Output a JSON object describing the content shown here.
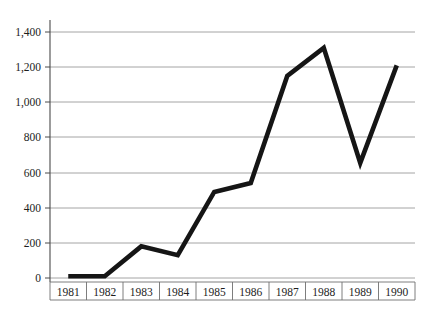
{
  "chart_data": {
    "type": "line",
    "title": "",
    "subtitle": "",
    "xlabel": "",
    "ylabel": "",
    "categories": [
      "1981",
      "1982",
      "1983",
      "1984",
      "1985",
      "1986",
      "1987",
      "1988",
      "1989",
      "1990"
    ],
    "values": [
      10,
      10,
      180,
      130,
      490,
      540,
      1150,
      1310,
      655,
      1210
    ],
    "series": [
      {
        "name": "",
        "values": [
          10,
          10,
          180,
          130,
          490,
          540,
          1150,
          1310,
          655,
          1210
        ]
      }
    ],
    "ylim": [
      0,
      1400
    ],
    "y_ticks": [
      0,
      200,
      400,
      600,
      800,
      1000,
      1200,
      1400
    ],
    "y_tick_labels": [
      "0",
      "200",
      "400",
      "600",
      "800",
      "1,000",
      "1,200",
      "1,400"
    ],
    "x_tick_labels": [
      "1981",
      "1982",
      "1983",
      "1984",
      "1985",
      "1986",
      "1987",
      "1988",
      "1989",
      "1990"
    ],
    "grid": "horizontal",
    "legend": "none",
    "annotations": [],
    "line_color": "#151515",
    "gridline_color": "#9a9a9a",
    "axis_color": "#4a4a4a",
    "background_color": "#ffffff"
  },
  "figure": {
    "caption_fragment": ""
  }
}
